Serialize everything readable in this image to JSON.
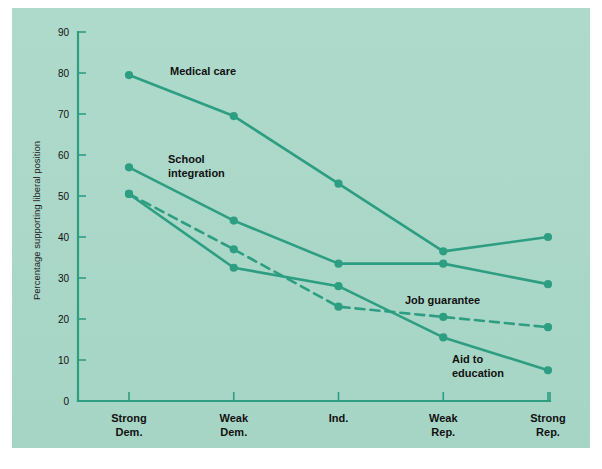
{
  "chart_data": {
    "type": "line",
    "title": "",
    "subtitle": "",
    "xlabel": "",
    "ylabel": "Percentage supporting liberal position",
    "categories": [
      "Strong\nDem.",
      "Weak\nDem.",
      "Ind.",
      "Weak\nRep.",
      "Strong\nRep."
    ],
    "category_labels": [
      {
        "line1": "Strong",
        "line2": "Dem."
      },
      {
        "line1": "Weak",
        "line2": "Dem."
      },
      {
        "line1": "Ind.",
        "line2": ""
      },
      {
        "line1": "Weak",
        "line2": "Rep."
      },
      {
        "line1": "Strong",
        "line2": "Rep."
      }
    ],
    "ylim": [
      0,
      90
    ],
    "yticks": [
      0,
      10,
      20,
      30,
      40,
      50,
      60,
      70,
      80,
      90
    ],
    "ytick_labels": [
      "0",
      "10",
      "20",
      "30",
      "40",
      "50",
      "60",
      "70",
      "80",
      "90"
    ],
    "grid": false,
    "legend": "inline-annotations",
    "series": [
      {
        "name": "Medical care",
        "style": "solid",
        "color": "#2e9e82",
        "values": [
          79.5,
          69.5,
          53,
          36.5,
          40
        ],
        "label_x": 170,
        "label_y": 75,
        "label_lines": [
          "Medical care"
        ]
      },
      {
        "name": "School integration",
        "style": "solid",
        "color": "#2e9e82",
        "values": [
          57,
          44,
          33.5,
          33.5,
          28.5
        ],
        "label_x": 168,
        "label_y": 163,
        "label_lines": [
          "School",
          "integration"
        ]
      },
      {
        "name": "Job guarantee",
        "style": "dashed",
        "color": "#2e9e82",
        "values": [
          50.5,
          37,
          23,
          20.5,
          18
        ],
        "label_x": 405,
        "label_y": 304,
        "label_lines": [
          "Job guarantee"
        ]
      },
      {
        "name": "Aid to education",
        "style": "solid",
        "color": "#2e9e82",
        "values": [
          50.5,
          32.5,
          28,
          15.5,
          7.5
        ],
        "label_x": 452,
        "label_y": 363,
        "label_lines": [
          "Aid to",
          "education"
        ]
      }
    ],
    "colors": {
      "background": "#a9d8c8",
      "line": "#2e9e82",
      "axis": "#2e9e82",
      "text": "#111111",
      "page": "#ffffff"
    }
  },
  "caption": {
    "text": ""
  }
}
